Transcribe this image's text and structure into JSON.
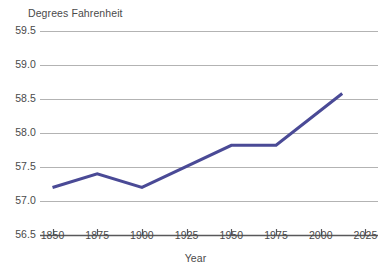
{
  "chart_data": {
    "type": "line",
    "title": "",
    "xlabel": "Year",
    "ylabel": "Degrees Fahrenheit",
    "x": [
      1850,
      1875,
      1900,
      1950,
      1975,
      2012
    ],
    "values": [
      57.2,
      57.4,
      57.2,
      57.82,
      57.82,
      58.58
    ],
    "series": [
      {
        "name": "Global average temperature",
        "x": [
          1850,
          1875,
          1900,
          1950,
          1975,
          2012
        ],
        "values": [
          57.2,
          57.4,
          57.2,
          57.82,
          57.82,
          58.58
        ]
      }
    ],
    "xlim": [
      1843,
      2032
    ],
    "ylim": [
      56.5,
      59.5
    ],
    "xticks": [
      1850,
      1875,
      1900,
      1925,
      1950,
      1975,
      2000,
      2025
    ],
    "xtick_labels": [
      "1850",
      "1875",
      "1900",
      "1925",
      "1950",
      "1975",
      "2000",
      "2025"
    ],
    "yticks": [
      56.5,
      57.0,
      57.5,
      58.0,
      58.5,
      59.0,
      59.5
    ],
    "ytick_labels": [
      "56.5",
      "57.0",
      "57.5",
      "58.0",
      "58.5",
      "59.0",
      "59.5"
    ],
    "grid": true,
    "grid_axis": "y",
    "legend": false,
    "legend_position": "none",
    "line_color": "#4a4a96",
    "grid_color": "#b3b3b3",
    "axis_color": "#58585a",
    "background": "#ffffff"
  },
  "axes": {
    "y_title": "Degrees Fahrenheit",
    "x_title": "Year"
  }
}
